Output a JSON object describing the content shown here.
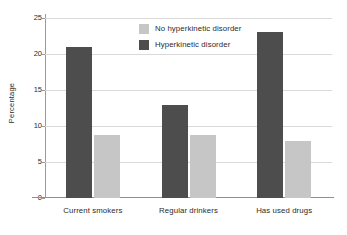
{
  "chart_data": {
    "type": "bar",
    "title": "",
    "subtitle": "",
    "xlabel": "",
    "ylabel": "Percentage",
    "categories": [
      "Current smokers",
      "Regular drinkers",
      "Has used drugs"
    ],
    "series": [
      {
        "name": "Hyperkinetic disorder",
        "color": "#4d4d4d",
        "values": [
          21.0,
          12.9,
          23.0
        ]
      },
      {
        "name": "No hyperkinetic disorder",
        "color": "#c6c6c6",
        "values": [
          8.8,
          8.8,
          7.9
        ]
      }
    ],
    "ylim": [
      0,
      25
    ],
    "yticks": [
      0,
      5,
      10,
      15,
      20,
      25
    ],
    "ytick_labels": [
      "0",
      "5",
      "10",
      "15",
      "20",
      "25"
    ],
    "grid": true,
    "grid_axis": "y",
    "legend_position": "top-center",
    "legend_order": [
      "No hyperkinetic disorder",
      "Hyperkinetic disorder"
    ]
  },
  "legend": {
    "entries": [
      {
        "label": "No hyperkinetic disorder",
        "swatch": "light"
      },
      {
        "label": "Hyperkinetic disorder",
        "swatch": "dark"
      }
    ]
  },
  "axes": {
    "y_title": "Percentage"
  }
}
